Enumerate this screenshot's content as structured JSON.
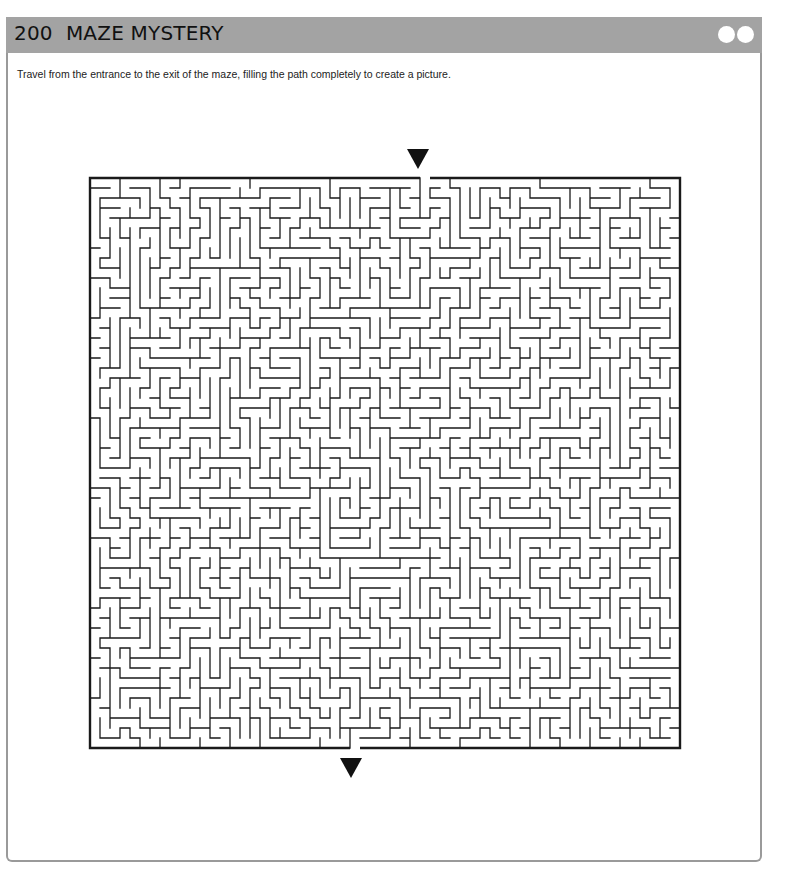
{
  "header": {
    "title": "200  MAZE MYSTERY",
    "bar_color": "#a3a3a3",
    "window_buttons": [
      "circle-button-1",
      "circle-button-2"
    ]
  },
  "instructions": "Travel from the entrance to the exit of the maze, filling the path completely to create a picture.",
  "maze": {
    "columns": 59,
    "rows": 57,
    "cell_px": 10,
    "entrance": {
      "side": "top",
      "column": 33,
      "marker": "down-triangle"
    },
    "exit": {
      "side": "bottom",
      "column": 26,
      "marker": "down-triangle"
    },
    "wall_color": "#1a1a1a"
  }
}
